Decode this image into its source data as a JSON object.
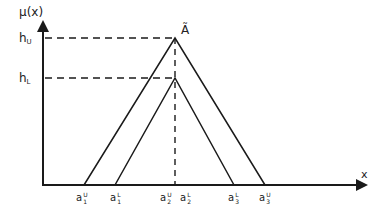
{
  "diagram": {
    "y_axis_label": "μ(x)",
    "x_axis_label": "x",
    "fuzzy_set_label": "Ã",
    "levels": [
      {
        "id": "h_U",
        "base": "h",
        "sub": "U",
        "y": 38
      },
      {
        "id": "h_L",
        "base": "h",
        "sub": "L",
        "y": 78
      }
    ],
    "x_ticks": [
      {
        "id": "a1U",
        "base": "a",
        "sub": "1",
        "sup": "U",
        "x": 84
      },
      {
        "id": "a1L",
        "base": "a",
        "sub": "1",
        "sup": "L",
        "x": 115
      },
      {
        "id": "a2U",
        "base": "a",
        "sub": "2",
        "sup": "U",
        "x": 168
      },
      {
        "id": "a2L",
        "base": "a",
        "sub": "2",
        "sup": "L",
        "x": 185
      },
      {
        "id": "a3L",
        "base": "a",
        "sub": "3",
        "sup": "L",
        "x": 234
      },
      {
        "id": "a3U",
        "base": "a",
        "sub": "3",
        "sup": "U",
        "x": 265
      }
    ],
    "upper_triangle": {
      "left": 84,
      "peak": [
        175,
        38
      ],
      "right": 265
    },
    "lower_triangle": {
      "left": 115,
      "peak": [
        175,
        78
      ],
      "right": 234
    },
    "line_color": "#1a1a1a"
  }
}
